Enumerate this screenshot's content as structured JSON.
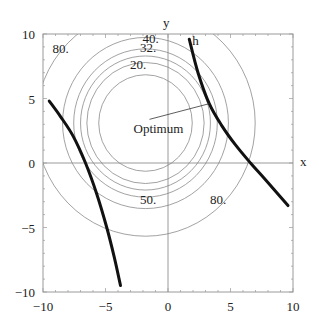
{
  "chart_data": {
    "type": "line",
    "subtype": "contour",
    "title": "",
    "xlabel": "x",
    "ylabel": "y",
    "xlim": [
      -10,
      10
    ],
    "ylim": [
      -10,
      10
    ],
    "xticks": [
      -10,
      -5,
      0,
      5,
      10
    ],
    "yticks": [
      -10,
      -5,
      0,
      5,
      10
    ],
    "xtick_labels": [
      "−10",
      "−5",
      "0",
      "5",
      "10"
    ],
    "ytick_labels": [
      "−10",
      "−5",
      "0",
      "5",
      "10"
    ],
    "grid": false,
    "objective": {
      "description": "concentric circular contours of (x - cx)^2 + (y - cy)^2",
      "center": [
        -1.8,
        3.1
      ],
      "levels": [
        14,
        22,
        27,
        33,
        44,
        77
      ]
    },
    "contour_labels": [
      {
        "text": "20.",
        "x": -2.4,
        "y": 7.6
      },
      {
        "text": "32.",
        "x": -1.6,
        "y": 8.9
      },
      {
        "text": "40.",
        "x": -1.4,
        "y": 9.6
      },
      {
        "text": "50.",
        "x": -1.6,
        "y": -2.9
      },
      {
        "text": "80.",
        "x": 4.0,
        "y": -2.9
      },
      {
        "text": "80.",
        "x": -8.6,
        "y": 8.8
      }
    ],
    "constraint_curves": [
      {
        "name": "h-right",
        "label": "h",
        "points": [
          [
            1.7,
            9.6
          ],
          [
            2.4,
            7.0
          ],
          [
            3.3,
            4.6
          ],
          [
            4.3,
            2.9
          ],
          [
            5.4,
            1.4
          ],
          [
            6.6,
            0.0
          ],
          [
            7.8,
            -1.3
          ],
          [
            9.6,
            -3.3
          ]
        ]
      },
      {
        "name": "h-left",
        "label": "",
        "points": [
          [
            -9.5,
            4.8
          ],
          [
            -8.6,
            3.6
          ],
          [
            -7.6,
            2.1
          ],
          [
            -6.6,
            0.0
          ],
          [
            -5.7,
            -2.4
          ],
          [
            -4.9,
            -5.0
          ],
          [
            -4.3,
            -7.3
          ],
          [
            -3.8,
            -9.5
          ]
        ]
      }
    ],
    "annotations": [
      {
        "text": "Optimum",
        "label_at": [
          -1.8,
          2.3
        ],
        "points_to": [
          3.3,
          4.6
        ]
      }
    ]
  }
}
